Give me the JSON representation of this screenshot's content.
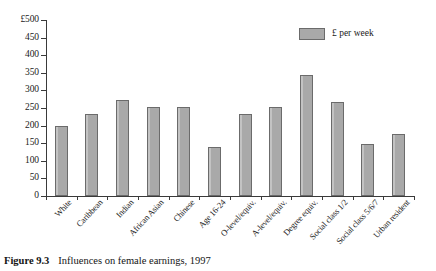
{
  "figure": {
    "caption_label": "Figure 9.3",
    "caption_text": "Influences on female earnings, 1997"
  },
  "legend": {
    "entries": [
      {
        "label": "£ per week",
        "color": "#a9a9a9"
      }
    ]
  },
  "chart_data": {
    "type": "bar",
    "title": "Influences on female earnings, 1997",
    "xlabel": "",
    "ylabel": "",
    "ylim": [
      0,
      500
    ],
    "ytick_labels": [
      "0",
      "50",
      "100",
      "150",
      "200",
      "250",
      "300",
      "350",
      "400",
      "450",
      "£500"
    ],
    "ytick_values": [
      0,
      50,
      100,
      150,
      200,
      250,
      300,
      350,
      400,
      450,
      500
    ],
    "grid": false,
    "legend_position": "top-right",
    "series_name": "£ per week",
    "bar_color": "#a9a9a9",
    "bar_edge_color": "#6b6b6b",
    "categories": [
      "White",
      "Caribbean",
      "Indian",
      "African Asian",
      "Chinese",
      "Age 16-24",
      "O-level/equiv.",
      "A-level/equiv.",
      "Degree equiv.",
      "Social class 1/2",
      "Social class 5/6/7",
      "Urban resident"
    ],
    "values": [
      200,
      232,
      272,
      252,
      252,
      140,
      232,
      252,
      345,
      268,
      148,
      175
    ]
  }
}
